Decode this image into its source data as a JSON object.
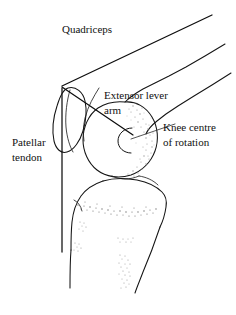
{
  "figure": {
    "width": 236,
    "height": 315,
    "background_color": "#ffffff",
    "line_color": "#141414",
    "stipple_color": "#9a9a9a"
  },
  "labels": {
    "quadriceps": "Quadriceps",
    "extensor_lever_arm_line1": "Extensor lever",
    "extensor_lever_arm_line2": "arm",
    "patellar_tendon_line1": "Patellar",
    "patellar_tendon_line2": "tendon",
    "knee_centre_line1": "Knee centre",
    "knee_centre_line2": "of rotation"
  },
  "anatomy": {
    "parts": [
      "femur-shaft",
      "femoral-condyle",
      "patella",
      "tibial-plateau",
      "tibial-shaft",
      "fibula",
      "growth-plate-stipple"
    ]
  },
  "force_lines": {
    "quadriceps_line": "quadriceps tendon line of pull",
    "patellar_tendon_line": "patellar tendon vertical line",
    "extensor_lever_arm_line": "moment arm from patella apex to knee centre of rotation"
  }
}
